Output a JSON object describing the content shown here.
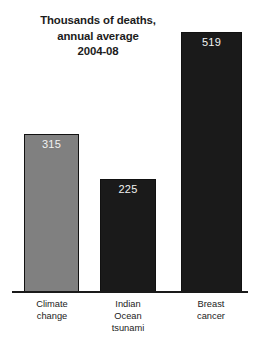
{
  "chart_data": {
    "type": "bar",
    "title": "Thousands of deaths, annual average 2004-08",
    "title_lines": [
      "Thousands of deaths,",
      "annual average",
      "2004-08"
    ],
    "categories": [
      "Climate change",
      "Indian Ocean tsunami",
      "Breast cancer"
    ],
    "values": [
      315,
      225,
      519
    ],
    "xlabel": "",
    "ylabel": "Thousands of deaths, annual average",
    "ylim": [
      0,
      519
    ],
    "grid": false,
    "legend": "none",
    "bars": [
      {
        "label": "Climate change",
        "label_lines": [
          "Climate",
          "change"
        ],
        "value": 315,
        "value_text": "315",
        "fill": "#808080",
        "border": "#111111",
        "value_color": "#f2f2f2"
      },
      {
        "label": "Indian Ocean tsunami",
        "label_lines": [
          "Indian",
          "Ocean",
          "tsunami"
        ],
        "value": 225,
        "value_text": "225",
        "fill": "#1a1a1a",
        "border": "#111111",
        "value_color": "#f2f2f2"
      },
      {
        "label": "Breast cancer",
        "label_lines": [
          "Breast",
          "cancer"
        ],
        "value": 519,
        "value_text": "519",
        "fill": "#1a1a1a",
        "border": "#111111",
        "value_color": "#f2f2f2"
      }
    ]
  },
  "colors": {
    "background": "#ffffff",
    "axis": "#1a1a1a",
    "title_text": "#1c1c1c",
    "label_text": "#222222"
  }
}
